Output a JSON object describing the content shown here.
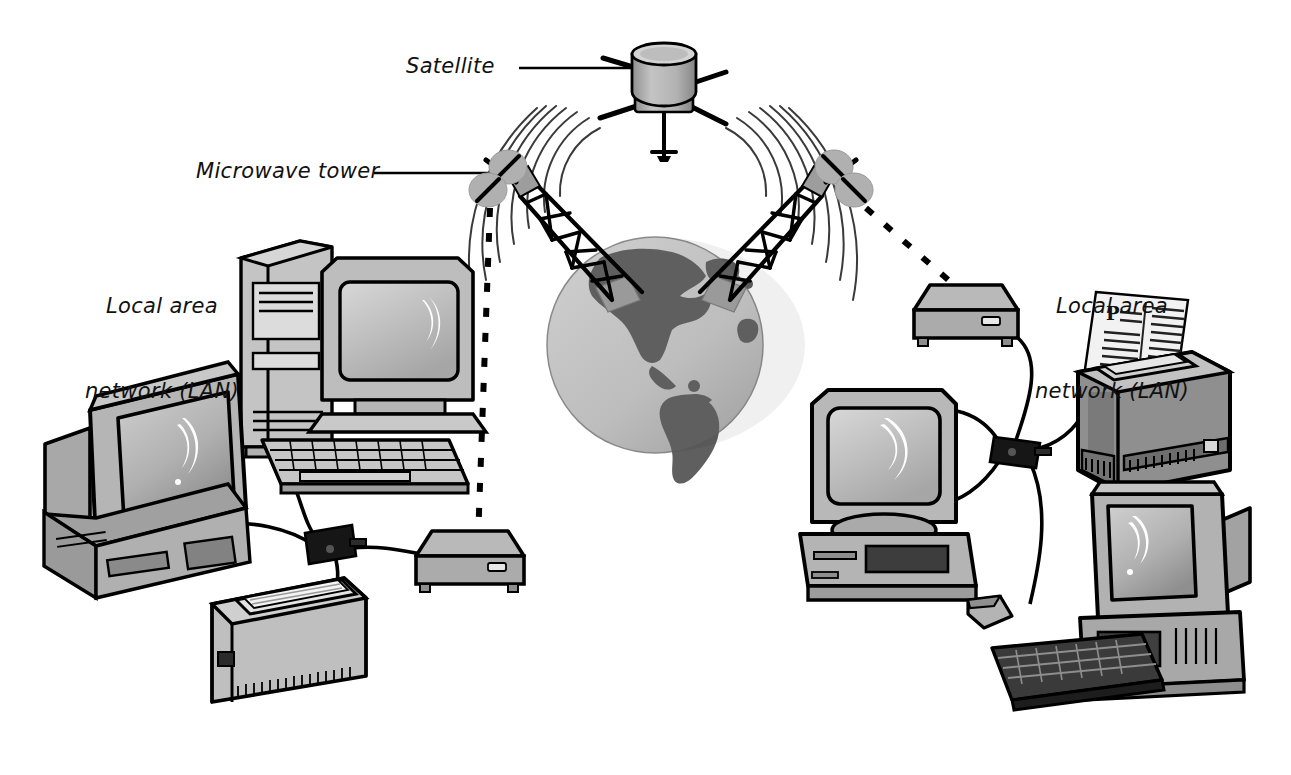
{
  "diagram": {
    "background_color": "#ffffff",
    "width": 1291,
    "height": 775
  },
  "labels": {
    "satellite": "Satellite",
    "microwave_tower": "Microwave tower",
    "lan_left_line1": "Local area",
    "lan_left_line2": "network (LAN)",
    "lan_right_line1": "Local area",
    "lan_right_line2": "network (LAN)"
  },
  "colors": {
    "outline": "#000000",
    "light_gray": "#c9c9c9",
    "mid_gray": "#9a9a9a",
    "dark_gray": "#6e6e6e",
    "screen_gray": "#b4b4b4",
    "highlight": "#ffffff",
    "globe_ocean": "#b9b9b9",
    "globe_land": "#5f5f5f",
    "dish_gray": "#b0b0b0",
    "hub_black": "#161616",
    "paper_white": "#f2f2f2"
  },
  "nodes": [
    {
      "id": "satellite",
      "type": "satellite",
      "label": "Satellite",
      "x": 663,
      "y": 80
    },
    {
      "id": "tower-left",
      "type": "microwave-tower",
      "label": "Microwave tower",
      "x": 540,
      "y": 230
    },
    {
      "id": "tower-right",
      "type": "microwave-tower",
      "label": "",
      "x": 770,
      "y": 230
    },
    {
      "id": "globe",
      "type": "globe",
      "label": "",
      "x": 655,
      "y": 345
    },
    {
      "id": "modem-left",
      "type": "modem",
      "label": "",
      "x": 470,
      "y": 545
    },
    {
      "id": "modem-right",
      "type": "modem",
      "label": "",
      "x": 965,
      "y": 300
    },
    {
      "id": "hub-left",
      "type": "network-hub",
      "label": "",
      "x": 325,
      "y": 545
    },
    {
      "id": "hub-right",
      "type": "network-hub",
      "label": "",
      "x": 1010,
      "y": 450
    },
    {
      "id": "monitor-left-front",
      "type": "crt-monitor",
      "label": "",
      "x": 120,
      "y": 440
    },
    {
      "id": "tower-pc-left",
      "type": "tower-pc",
      "label": "",
      "x": 275,
      "y": 330
    },
    {
      "id": "monitor-left-back",
      "type": "crt-monitor",
      "label": "",
      "x": 385,
      "y": 340
    },
    {
      "id": "keyboard-left",
      "type": "keyboard",
      "label": "",
      "x": 345,
      "y": 465
    },
    {
      "id": "scanner-left",
      "type": "scanner",
      "label": "",
      "x": 280,
      "y": 625
    },
    {
      "id": "desktop-pc-right",
      "type": "desktop-pc",
      "label": "",
      "x": 890,
      "y": 490
    },
    {
      "id": "mouse-right",
      "type": "mouse",
      "label": "",
      "x": 990,
      "y": 615
    },
    {
      "id": "printer-right",
      "type": "printer",
      "label": "",
      "x": 1155,
      "y": 400
    },
    {
      "id": "monitor-right-front",
      "type": "crt-monitor",
      "label": "",
      "x": 1150,
      "y": 560
    },
    {
      "id": "keyboard-right",
      "type": "keyboard",
      "label": "",
      "x": 1075,
      "y": 680
    }
  ],
  "links": [
    {
      "from": "satellite",
      "to": "tower-left",
      "style": "broadcast-waves"
    },
    {
      "from": "satellite",
      "to": "tower-right",
      "style": "broadcast-waves"
    },
    {
      "from": "tower-left",
      "to": "modem-left",
      "style": "dashed"
    },
    {
      "from": "tower-right",
      "to": "modem-right",
      "style": "dashed"
    },
    {
      "from": "hub-left",
      "to": "modem-left",
      "style": "cable"
    },
    {
      "from": "hub-left",
      "to": "monitor-left-front",
      "style": "cable"
    },
    {
      "from": "hub-left",
      "to": "scanner-left",
      "style": "cable"
    },
    {
      "from": "hub-left",
      "to": "tower-pc-left",
      "style": "cable"
    },
    {
      "from": "hub-right",
      "to": "modem-right",
      "style": "cable"
    },
    {
      "from": "hub-right",
      "to": "desktop-pc-right",
      "style": "cable"
    },
    {
      "from": "hub-right",
      "to": "printer-right",
      "style": "cable"
    },
    {
      "from": "hub-right",
      "to": "monitor-right-front",
      "style": "cable"
    },
    {
      "from": "desktop-pc-right",
      "to": "mouse-right",
      "style": "cable"
    }
  ]
}
